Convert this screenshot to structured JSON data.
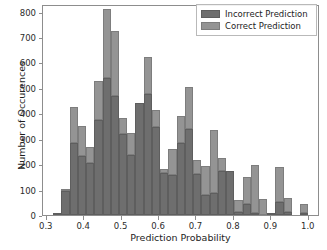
{
  "chart_data": {
    "type": "bar",
    "title": "",
    "xlabel": "Prediction Probability",
    "ylabel": "Number of Occurences",
    "xlim": [
      0.29,
      1.03
    ],
    "ylim": [
      0,
      830
    ],
    "grid": false,
    "legend_position": "upper right",
    "xticks": [
      "0.3",
      "0.4",
      "0.5",
      "0.6",
      "0.7",
      "0.8",
      "0.9",
      "1.0"
    ],
    "xtick_values": [
      0.3,
      0.4,
      0.5,
      0.6,
      0.7,
      0.8,
      0.9,
      1.0
    ],
    "yticks": [
      "0",
      "100",
      "200",
      "300",
      "400",
      "500",
      "600",
      "700",
      "800"
    ],
    "ytick_values": [
      0,
      100,
      200,
      300,
      400,
      500,
      600,
      700,
      800
    ],
    "bin_width": 0.022,
    "x": [
      0.306,
      0.328,
      0.35,
      0.372,
      0.394,
      0.416,
      0.438,
      0.46,
      0.482,
      0.504,
      0.526,
      0.548,
      0.57,
      0.592,
      0.614,
      0.636,
      0.658,
      0.68,
      0.702,
      0.724,
      0.746,
      0.768,
      0.79,
      0.812,
      0.834,
      0.856,
      0.878,
      0.9,
      0.922,
      0.944,
      0.966,
      0.988
    ],
    "series": [
      {
        "name": "Incorrect Prediction",
        "color": "#6e6e6e",
        "values": [
          0,
          2,
          93,
          285,
          233,
          203,
          375,
          538,
          470,
          320,
          235,
          440,
          475,
          345,
          165,
          158,
          285,
          338,
          160,
          80,
          88,
          175,
          172,
          13,
          150,
          8,
          0,
          5,
          52,
          10,
          0,
          8
        ]
      },
      {
        "name": "Correct Prediction",
        "color": "#949494",
        "values": [
          0,
          2,
          103,
          423,
          351,
          268,
          527,
          810,
          722,
          383,
          322,
          440,
          620,
          415,
          180,
          258,
          388,
          503,
          215,
          192,
          333,
          225,
          175,
          58,
          42,
          197,
          63,
          5,
          190,
          68,
          0,
          43
        ]
      }
    ],
    "legend": [
      {
        "label": "Incorrect Prediction",
        "color": "#6e6e6e"
      },
      {
        "label": "Correct Prediction",
        "color": "#949494"
      }
    ]
  }
}
